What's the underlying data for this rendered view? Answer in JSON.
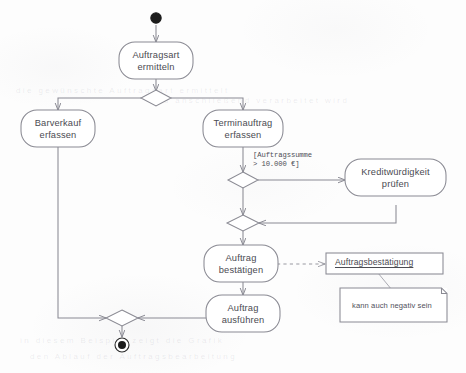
{
  "diagram": {
    "type": "uml-activity-diagram",
    "title": "Auftragsbearbeitung",
    "colors": {
      "stroke": "#8a8a93",
      "text": "#4b4b52",
      "background": "#fdfdfd",
      "node_fill": "#ffffff",
      "initial_node_fill": "#1a1a1a"
    }
  },
  "nodes": {
    "initial": {
      "name": "initial-node",
      "shape": "filled-circle"
    },
    "final": {
      "name": "final-node",
      "shape": "bullseye-circle"
    },
    "activities": [
      {
        "id": "auftragsart",
        "label": "Auftragsart\nermitteln"
      },
      {
        "id": "barverkauf",
        "label": "Barverkauf\nerfassen"
      },
      {
        "id": "terminauftrag",
        "label": "Terminauftrag\nerfassen"
      },
      {
        "id": "kredit",
        "label": "Kreditwürdigkeit\nprüfen"
      },
      {
        "id": "bestaetigen",
        "label": "Auftrag\nbestätigen"
      },
      {
        "id": "ausfuehren",
        "label": "Auftrag\nausführen"
      }
    ],
    "decisions": [
      {
        "id": "decision-auftragsart",
        "label": ""
      },
      {
        "id": "decision-summe",
        "label": ""
      },
      {
        "id": "merge-kredit",
        "label": ""
      },
      {
        "id": "merge-final",
        "label": ""
      }
    ],
    "object_node": {
      "id": "auftragsbestaetigung",
      "label": "Auftragsbestätigung"
    },
    "note": {
      "id": "note-negativ",
      "label": "kann auch negativ sein"
    }
  },
  "edges": {
    "guard_summe": "[Auftragssumme\n > 10.000 €]"
  },
  "ghost_text": {
    "lines": [
      "die  gewünschte  Auftragsart  ermittelt",
      "und  anschließend  verarbeitet  wird",
      "in  diesem  Beispiel  zeigt  die  Grafik",
      "den  Ablauf  der  Auftragsbearbeitung"
    ]
  }
}
